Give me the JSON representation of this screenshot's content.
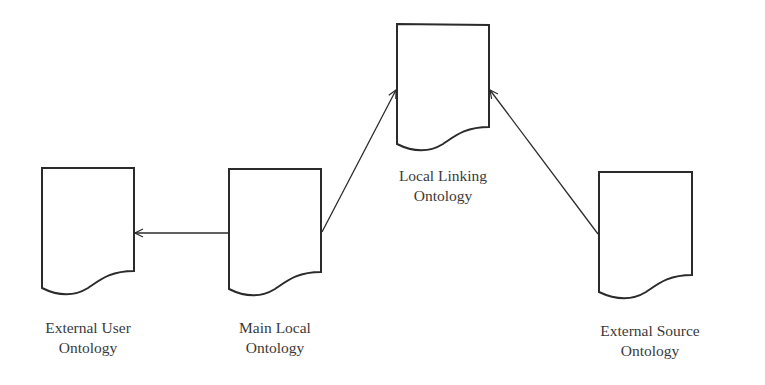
{
  "diagram": {
    "stroke_color": "#2b2b2b",
    "text_color": "#3a3a3a",
    "nodes": [
      {
        "id": "external-user",
        "line1": "External User",
        "line2": "Ontology"
      },
      {
        "id": "main-local",
        "line1": "Main Local",
        "line2": "Ontology"
      },
      {
        "id": "local-linking",
        "line1": "Local Linking",
        "line2": "Ontology"
      },
      {
        "id": "external-source",
        "line1": "External Source",
        "line2": "Ontology"
      }
    ],
    "edges": [
      {
        "from": "main-local",
        "to": "external-user"
      },
      {
        "from": "main-local",
        "to": "local-linking"
      },
      {
        "from": "external-source",
        "to": "local-linking"
      }
    ]
  }
}
